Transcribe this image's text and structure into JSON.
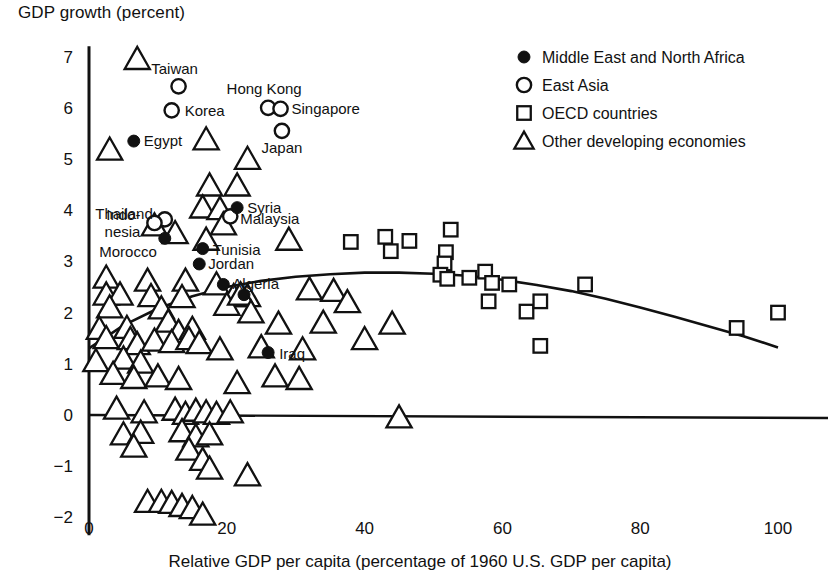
{
  "chart_data": {
    "type": "scatter",
    "title": "GDP growth (percent)",
    "xlabel": "Relative GDP per capita (percentage of 1960 U.S. GDP per capita)",
    "ylabel": "GDP growth (percent)",
    "xlim": [
      0,
      102
    ],
    "ylim": [
      -2.35,
      7.2
    ],
    "xticks": [
      0,
      20,
      40,
      60,
      80,
      100
    ],
    "yticks": [
      -2,
      -1,
      0,
      1,
      2,
      3,
      4,
      5,
      6,
      7
    ],
    "xtick_labels": [
      "0",
      "20",
      "40",
      "60",
      "80",
      "100"
    ],
    "ytick_labels": [
      "−2",
      "−1",
      "0",
      "1",
      "2",
      "3",
      "4",
      "5",
      "6",
      "7"
    ],
    "grid": false,
    "zero_line": true,
    "legend_position": "top-right",
    "legend": [
      {
        "key": "mena",
        "marker": "filled-circle",
        "label": "Middle East and North Africa"
      },
      {
        "key": "east_asia",
        "marker": "open-circle",
        "label": "East Asia"
      },
      {
        "key": "oecd",
        "marker": "open-square",
        "label": "OECD countries"
      },
      {
        "key": "other",
        "marker": "open-triangle",
        "label": "Other developing economies"
      }
    ],
    "fit_curve": {
      "name": "quadratic fit",
      "points": [
        [
          0,
          1.3
        ],
        [
          5,
          1.75
        ],
        [
          10,
          2.08
        ],
        [
          15,
          2.32
        ],
        [
          20,
          2.5
        ],
        [
          25,
          2.62
        ],
        [
          30,
          2.7
        ],
        [
          35,
          2.75
        ],
        [
          40,
          2.78
        ],
        [
          45,
          2.78
        ],
        [
          50,
          2.76
        ],
        [
          55,
          2.72
        ],
        [
          60,
          2.64
        ],
        [
          65,
          2.54
        ],
        [
          70,
          2.42
        ],
        [
          75,
          2.27
        ],
        [
          80,
          2.1
        ],
        [
          85,
          1.92
        ],
        [
          90,
          1.73
        ],
        [
          95,
          1.54
        ],
        [
          100,
          1.32
        ]
      ]
    },
    "series": [
      {
        "name": "Middle East and North Africa",
        "key": "mena",
        "marker": "filled-circle",
        "points": [
          {
            "x": 6.5,
            "y": 5.35,
            "label": "Egypt",
            "label_pos": "right"
          },
          {
            "x": 11.0,
            "y": 3.45,
            "label": "Morocco",
            "label_pos": "below-left"
          },
          {
            "x": 16.5,
            "y": 3.25,
            "label": "Tunisia",
            "label_pos": "right"
          },
          {
            "x": 16.0,
            "y": 2.95,
            "label": "Jordan",
            "label_pos": "right"
          },
          {
            "x": 19.5,
            "y": 2.55,
            "label": "Algeria",
            "label_pos": "right"
          },
          {
            "x": 21.5,
            "y": 4.05,
            "label": "Syria",
            "label_pos": "right"
          },
          {
            "x": 26.0,
            "y": 1.22,
            "label": "Iraq",
            "label_pos": "right"
          },
          {
            "x": 22.5,
            "y": 2.35,
            "label": "",
            "label_pos": ""
          }
        ]
      },
      {
        "name": "East Asia",
        "key": "east_asia",
        "marker": "open-circle",
        "points": [
          {
            "x": 13.0,
            "y": 6.42,
            "label": "Taiwan",
            "label_pos": "above"
          },
          {
            "x": 12.0,
            "y": 5.95,
            "label": "Korea",
            "label_pos": "right"
          },
          {
            "x": 26.0,
            "y": 6.0,
            "label": "Hong Kong",
            "label_pos": "above"
          },
          {
            "x": 27.8,
            "y": 5.98,
            "label": "Singapore",
            "label_pos": "right"
          },
          {
            "x": 28.0,
            "y": 5.55,
            "label": "Japan",
            "label_pos": "below"
          },
          {
            "x": 11.0,
            "y": 3.82,
            "label": "Thailand",
            "label_pos": "left"
          },
          {
            "x": 9.5,
            "y": 3.75,
            "label": "Indo-\nnesia",
            "label_pos": "left"
          },
          {
            "x": 20.5,
            "y": 3.88,
            "label": "Malaysia",
            "label_pos": "right"
          }
        ]
      },
      {
        "name": "OECD countries",
        "key": "oecd",
        "marker": "open-square",
        "points": [
          {
            "x": 38.0,
            "y": 3.38
          },
          {
            "x": 43.0,
            "y": 3.48
          },
          {
            "x": 43.8,
            "y": 3.2
          },
          {
            "x": 46.5,
            "y": 3.4
          },
          {
            "x": 52.5,
            "y": 3.62
          },
          {
            "x": 51.8,
            "y": 3.18
          },
          {
            "x": 51.6,
            "y": 2.96
          },
          {
            "x": 51.0,
            "y": 2.74
          },
          {
            "x": 52.0,
            "y": 2.66
          },
          {
            "x": 55.2,
            "y": 2.68
          },
          {
            "x": 57.5,
            "y": 2.8
          },
          {
            "x": 58.5,
            "y": 2.58
          },
          {
            "x": 61.0,
            "y": 2.55
          },
          {
            "x": 58.0,
            "y": 2.22
          },
          {
            "x": 63.5,
            "y": 2.02
          },
          {
            "x": 65.5,
            "y": 2.22
          },
          {
            "x": 65.5,
            "y": 1.35
          },
          {
            "x": 72.0,
            "y": 2.55
          },
          {
            "x": 94.0,
            "y": 1.7
          },
          {
            "x": 100.0,
            "y": 2.0
          }
        ]
      },
      {
        "name": "Other developing economies",
        "key": "other",
        "marker": "open-triangle",
        "points": [
          {
            "x": 7.0,
            "y": 6.95
          },
          {
            "x": 3.0,
            "y": 5.18
          },
          {
            "x": 17.0,
            "y": 5.38
          },
          {
            "x": 23.0,
            "y": 5.0
          },
          {
            "x": 17.5,
            "y": 4.48
          },
          {
            "x": 21.5,
            "y": 4.48
          },
          {
            "x": 16.5,
            "y": 4.05
          },
          {
            "x": 19.0,
            "y": 4.02
          },
          {
            "x": 9.5,
            "y": 3.7
          },
          {
            "x": 12.5,
            "y": 3.55
          },
          {
            "x": 19.5,
            "y": 3.72
          },
          {
            "x": 17.0,
            "y": 3.42
          },
          {
            "x": 29.0,
            "y": 3.42
          },
          {
            "x": 2.5,
            "y": 2.68
          },
          {
            "x": 8.5,
            "y": 2.62
          },
          {
            "x": 14.0,
            "y": 2.62
          },
          {
            "x": 18.5,
            "y": 2.55
          },
          {
            "x": 2.5,
            "y": 2.35
          },
          {
            "x": 4.5,
            "y": 2.35
          },
          {
            "x": 9.0,
            "y": 2.32
          },
          {
            "x": 13.5,
            "y": 2.3
          },
          {
            "x": 21.0,
            "y": 2.32
          },
          {
            "x": 23.0,
            "y": 2.32
          },
          {
            "x": 32.0,
            "y": 2.45
          },
          {
            "x": 35.5,
            "y": 2.42
          },
          {
            "x": 3.0,
            "y": 2.1
          },
          {
            "x": 10.5,
            "y": 2.08
          },
          {
            "x": 20.0,
            "y": 2.15
          },
          {
            "x": 22.0,
            "y": 2.35
          },
          {
            "x": 23.5,
            "y": 2.0
          },
          {
            "x": 37.5,
            "y": 2.2
          },
          {
            "x": 1.5,
            "y": 1.68
          },
          {
            "x": 5.5,
            "y": 1.7
          },
          {
            "x": 11.5,
            "y": 1.82
          },
          {
            "x": 13.0,
            "y": 1.62
          },
          {
            "x": 15.0,
            "y": 1.68
          },
          {
            "x": 2.5,
            "y": 1.5
          },
          {
            "x": 6.0,
            "y": 1.48
          },
          {
            "x": 7.0,
            "y": 1.38
          },
          {
            "x": 9.5,
            "y": 1.45
          },
          {
            "x": 12.0,
            "y": 1.42
          },
          {
            "x": 14.5,
            "y": 1.48
          },
          {
            "x": 16.0,
            "y": 1.4
          },
          {
            "x": 27.5,
            "y": 1.78
          },
          {
            "x": 34.0,
            "y": 1.8
          },
          {
            "x": 44.0,
            "y": 1.78
          },
          {
            "x": 1.0,
            "y": 1.05
          },
          {
            "x": 5.0,
            "y": 1.1
          },
          {
            "x": 7.5,
            "y": 1.02
          },
          {
            "x": 19.0,
            "y": 1.28
          },
          {
            "x": 25.0,
            "y": 1.32
          },
          {
            "x": 31.0,
            "y": 1.28
          },
          {
            "x": 40.0,
            "y": 1.48
          },
          {
            "x": 3.5,
            "y": 0.8
          },
          {
            "x": 6.5,
            "y": 0.72
          },
          {
            "x": 10.0,
            "y": 0.75
          },
          {
            "x": 13.0,
            "y": 0.7
          },
          {
            "x": 21.5,
            "y": 0.62
          },
          {
            "x": 27.0,
            "y": 0.75
          },
          {
            "x": 30.5,
            "y": 0.7
          },
          {
            "x": 4.0,
            "y": 0.12
          },
          {
            "x": 8.0,
            "y": 0.05
          },
          {
            "x": 12.5,
            "y": 0.1
          },
          {
            "x": 14.0,
            "y": 0.02
          },
          {
            "x": 15.5,
            "y": 0.08
          },
          {
            "x": 17.0,
            "y": 0.05
          },
          {
            "x": 18.5,
            "y": 0.02
          },
          {
            "x": 20.5,
            "y": 0.05
          },
          {
            "x": 45.0,
            "y": -0.05
          },
          {
            "x": 5.0,
            "y": -0.38
          },
          {
            "x": 7.5,
            "y": -0.35
          },
          {
            "x": 13.5,
            "y": -0.32
          },
          {
            "x": 15.5,
            "y": -0.42
          },
          {
            "x": 17.5,
            "y": -0.38
          },
          {
            "x": 6.5,
            "y": -0.62
          },
          {
            "x": 14.5,
            "y": -0.68
          },
          {
            "x": 16.5,
            "y": -0.88
          },
          {
            "x": 17.5,
            "y": -1.05
          },
          {
            "x": 23.0,
            "y": -1.18
          },
          {
            "x": 8.5,
            "y": -1.7
          },
          {
            "x": 10.5,
            "y": -1.7
          },
          {
            "x": 12.0,
            "y": -1.72
          },
          {
            "x": 13.5,
            "y": -1.78
          },
          {
            "x": 15.0,
            "y": -1.82
          },
          {
            "x": 16.5,
            "y": -1.95
          }
        ]
      }
    ]
  }
}
